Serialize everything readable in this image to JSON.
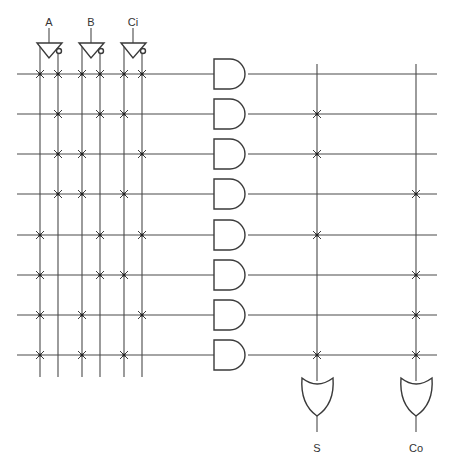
{
  "diagram": {
    "inputs": [
      {
        "label": "A",
        "true_x": 40,
        "comp_x": 58,
        "center_x": 49
      },
      {
        "label": "B",
        "true_x": 82,
        "comp_x": 100,
        "center_x": 91
      },
      {
        "label": "Ci",
        "true_x": 124,
        "comp_x": 142,
        "center_x": 133
      }
    ],
    "product_rows_y": [
      74,
      114,
      154,
      194,
      235,
      275,
      315,
      355
    ],
    "and_plane": {
      "columns_x": [
        40,
        58,
        82,
        100,
        124,
        142
      ],
      "column_names": [
        "A",
        "A'",
        "B",
        "B'",
        "Ci",
        "Ci'"
      ],
      "connections": [
        [
          0,
          1,
          2,
          3,
          4,
          5
        ],
        [
          1,
          3,
          4
        ],
        [
          1,
          2,
          5
        ],
        [
          1,
          2,
          4
        ],
        [
          0,
          3,
          5
        ],
        [
          0,
          3,
          4
        ],
        [
          0,
          2,
          5
        ],
        [
          0,
          2,
          4
        ]
      ]
    },
    "or_plane": {
      "outputs": [
        {
          "label": "S",
          "x": 317,
          "rows": [
            1,
            2,
            4,
            7
          ]
        },
        {
          "label": "Co",
          "x": 416,
          "rows": [
            3,
            5,
            6,
            7
          ]
        }
      ]
    },
    "colors": {
      "line": "#4a4a4a",
      "gate": "#3a3a3a",
      "background": "#ffffff"
    }
  }
}
